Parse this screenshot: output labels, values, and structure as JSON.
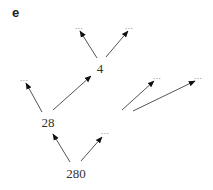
{
  "panel": {
    "label": "e"
  },
  "nodes": [
    {
      "id": "n4",
      "label": "4",
      "x": 100,
      "y": 68
    },
    {
      "id": "n4a",
      "label": "...",
      "x": 79,
      "y": 26
    },
    {
      "id": "n4b",
      "label": "...",
      "x": 129,
      "y": 26
    },
    {
      "id": "n28",
      "label": "28",
      "x": 48,
      "y": 122
    },
    {
      "id": "n28a",
      "label": "...",
      "x": 24,
      "y": 78
    },
    {
      "id": "n280",
      "label": "280",
      "x": 76,
      "y": 173
    },
    {
      "id": "n280b",
      "label": "...",
      "x": 105,
      "y": 131
    },
    {
      "id": "nra",
      "label": "...",
      "x": 157,
      "y": 76
    },
    {
      "id": "nrb",
      "label": "...",
      "x": 198,
      "y": 76
    }
  ],
  "edges": [
    {
      "from": "n4",
      "to": "n4a",
      "x1": 97,
      "y1": 58,
      "x2": 80,
      "y2": 31
    },
    {
      "from": "n4",
      "to": "n4b",
      "x1": 106,
      "y1": 57,
      "x2": 128,
      "y2": 31
    },
    {
      "from": "n28",
      "to": "n28a",
      "x1": 42,
      "y1": 112,
      "x2": 26,
      "y2": 83
    },
    {
      "from": "n28",
      "to": "n4",
      "x1": 53,
      "y1": 110,
      "x2": 91,
      "y2": 76
    },
    {
      "from": "n280",
      "to": "n28",
      "x1": 70,
      "y1": 162,
      "x2": 53,
      "y2": 134
    },
    {
      "from": "n280",
      "to": "n280b",
      "x1": 81,
      "y1": 161,
      "x2": 102,
      "y2": 137
    },
    {
      "from": "",
      "to": "nra",
      "x1": 122,
      "y1": 110,
      "x2": 154,
      "y2": 81
    },
    {
      "from": "",
      "to": "nrb",
      "x1": 133,
      "y1": 111,
      "x2": 195,
      "y2": 81
    }
  ],
  "colors": {
    "line": "#555555",
    "arrowhead": "#111111",
    "text": "#333333"
  }
}
